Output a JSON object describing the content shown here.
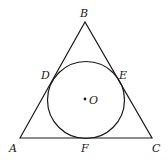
{
  "diagram": {
    "stroke_color": "#1a1a1a",
    "background": "#ffffff",
    "triangle": {
      "vertices": {
        "A": {
          "x": 20,
          "y": 138
        },
        "B": {
          "x": 85,
          "y": 22
        },
        "C": {
          "x": 152,
          "y": 138
        }
      }
    },
    "circle": {
      "center": {
        "x": 86,
        "y": 100
      },
      "radius": 38.5
    },
    "center_dot": {
      "x": 85,
      "y": 99,
      "r": 1.4
    },
    "labels": [
      {
        "id": "A",
        "text": "A",
        "x": 9,
        "y": 152
      },
      {
        "id": "B",
        "text": "B",
        "x": 80,
        "y": 17
      },
      {
        "id": "C",
        "text": "C",
        "x": 152,
        "y": 152
      },
      {
        "id": "D",
        "text": "D",
        "x": 41,
        "y": 79
      },
      {
        "id": "E",
        "text": "E",
        "x": 119,
        "y": 79
      },
      {
        "id": "F",
        "text": "F",
        "x": 81,
        "y": 152
      },
      {
        "id": "O",
        "text": "O",
        "x": 89,
        "y": 104
      }
    ]
  }
}
